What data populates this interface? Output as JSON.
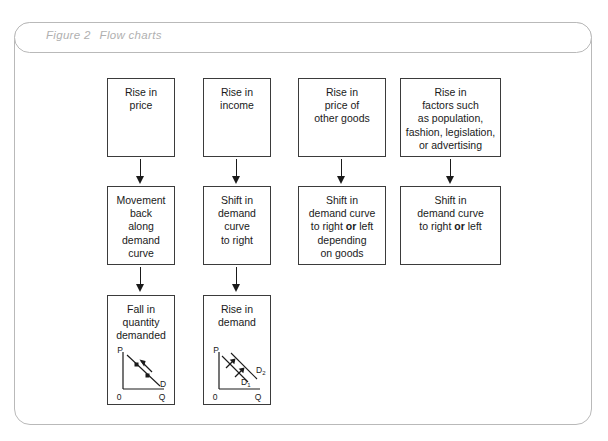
{
  "figure": {
    "label": "Figure 2",
    "title": "Flow charts",
    "frame_color": "#b9b9b9",
    "title_color": "#b0b0b0",
    "box_border_color": "#3b3b3b",
    "ink_color": "#1a1a1a"
  },
  "columns": [
    {
      "id": "col-price",
      "top": {
        "lines": [
          "Rise in",
          "price"
        ]
      },
      "middle": {
        "lines": [
          "Movement",
          "back",
          "along",
          "demand",
          "curve"
        ]
      },
      "bottom": {
        "lines": [
          "Fall in",
          "quantity",
          "demanded"
        ]
      }
    },
    {
      "id": "col-income",
      "top": {
        "lines": [
          "Rise in",
          "income"
        ]
      },
      "middle": {
        "lines": [
          "Shift in",
          "demand",
          "curve",
          "to right"
        ]
      },
      "bottom": {
        "lines": [
          "Rise in",
          "demand"
        ]
      }
    },
    {
      "id": "col-other-goods",
      "top": {
        "lines": [
          "Rise in",
          "price of",
          "other goods"
        ]
      },
      "middle": {
        "html": "Shift in<br>demand curve<br>to right <b>or</b> left<br>depending<br>on goods"
      }
    },
    {
      "id": "col-factors",
      "top": {
        "lines": [
          "Rise in",
          "factors such",
          "as population,",
          "fashion, legislation,",
          "or advertising"
        ]
      },
      "middle": {
        "html": "Shift in<br>demand curve<br>to right <b>or</b> left"
      }
    }
  ],
  "chart_data": [
    {
      "id": "chart-fall-in-quantity-demanded",
      "type": "line",
      "title": "Fall in quantity demanded",
      "xlabel": "Q",
      "ylabel": "P",
      "origin_label": "0",
      "series": [
        {
          "name": "D",
          "label": "D",
          "points": [
            [
              0.12,
              0.92
            ],
            [
              0.88,
              0.18
            ]
          ]
        }
      ],
      "markers": [
        {
          "x": 0.35,
          "y": 0.7
        },
        {
          "x": 0.62,
          "y": 0.44
        }
      ],
      "annotations": [
        {
          "type": "arrow",
          "direction": "up-left",
          "from": [
            0.72,
            0.32
          ],
          "to": [
            0.46,
            0.62
          ]
        }
      ],
      "note": "movement back along the demand curve"
    },
    {
      "id": "chart-rise-in-demand",
      "type": "line",
      "title": "Rise in demand",
      "xlabel": "Q",
      "ylabel": "P",
      "origin_label": "0",
      "series": [
        {
          "name": "D1",
          "label": "D",
          "sub": "1",
          "points": [
            [
              0.1,
              0.88
            ],
            [
              0.74,
              0.2
            ]
          ]
        },
        {
          "name": "D2",
          "label": "D",
          "sub": "2",
          "points": [
            [
              0.3,
              0.95
            ],
            [
              0.94,
              0.3
            ]
          ]
        }
      ],
      "annotations": [
        {
          "type": "arrow",
          "direction": "up-right",
          "from": [
            0.28,
            0.62
          ],
          "to": [
            0.46,
            0.82
          ]
        },
        {
          "type": "arrow",
          "direction": "up-right",
          "from": [
            0.5,
            0.4
          ],
          "to": [
            0.68,
            0.6
          ]
        }
      ],
      "note": "shift of the demand curve to the right"
    }
  ]
}
